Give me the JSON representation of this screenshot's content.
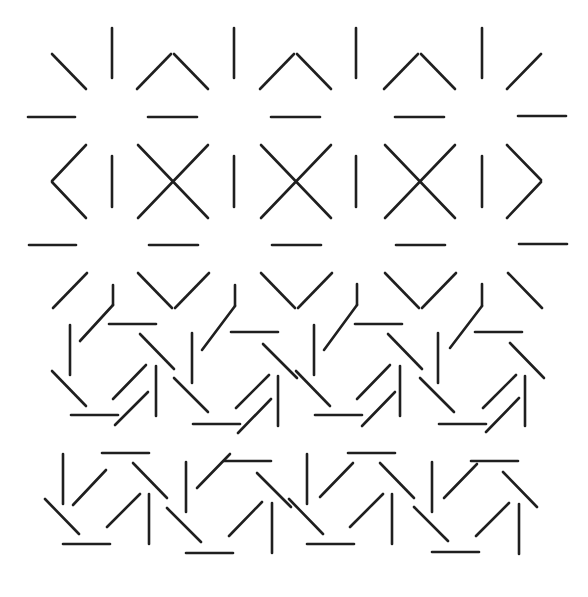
{
  "figure": {
    "stroke_color": "#1f1f1f",
    "background_color": "#ffffff",
    "regions": [
      {
        "name": "regular-grid-region",
        "pattern": "oriented segments forming X and chevron shapes"
      },
      {
        "name": "pinwheel-region",
        "pattern": "rotated segment groups forming pinwheels"
      }
    ]
  }
}
